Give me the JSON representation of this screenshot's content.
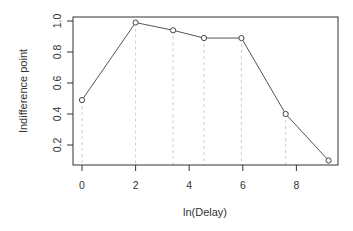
{
  "chart_data": {
    "type": "line",
    "title": "",
    "xlabel": "ln(Delay)",
    "ylabel": "Indifference point",
    "x": [
      0,
      2,
      3.4,
      4.55,
      5.95,
      7.6,
      9.2
    ],
    "values": [
      0.49,
      0.99,
      0.94,
      0.89,
      0.89,
      0.4,
      0.1
    ],
    "xlim": [
      -0.3,
      9.5
    ],
    "ylim": [
      0.07,
      1.03
    ],
    "xticks": [
      0,
      2,
      4,
      6,
      8
    ],
    "yticks": [
      0.2,
      0.4,
      0.6,
      0.8,
      1.0
    ],
    "xtick_labels": [
      "0",
      "2",
      "4",
      "6",
      "8"
    ],
    "ytick_labels": [
      "0.2",
      "0.4",
      "0.6",
      "0.8",
      "1.0"
    ],
    "grid": false,
    "drop_lines": "dashed vertical lines from each point to x-axis",
    "marker": "open circle",
    "line_color": "#555555",
    "drop_line_color": "#cccccc",
    "legend": null
  }
}
